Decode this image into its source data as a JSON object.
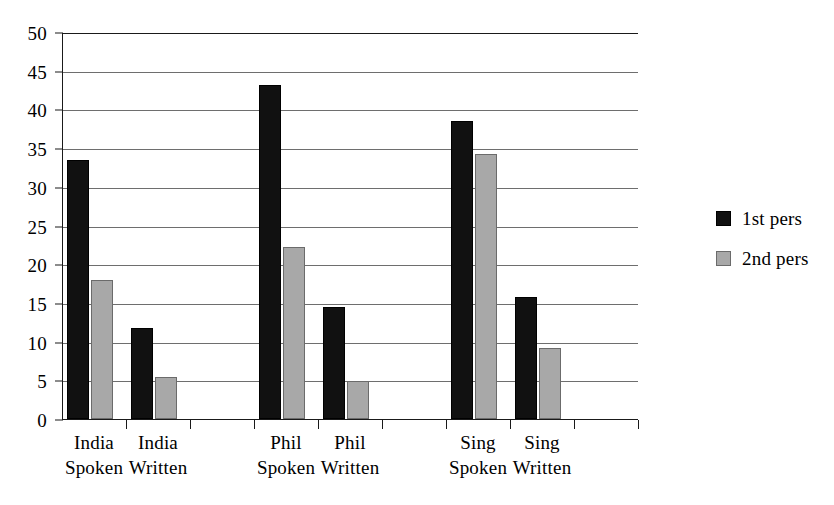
{
  "chart_data": {
    "type": "bar",
    "title": "",
    "subtitle": "",
    "xlabel": "",
    "ylabel": "",
    "ylim": [
      0,
      50
    ],
    "ytick_step": 5,
    "yticks": [
      0,
      5,
      10,
      15,
      20,
      25,
      30,
      35,
      40,
      45,
      50
    ],
    "ytick_labels": [
      "0",
      "5",
      "10",
      "15",
      "20",
      "25",
      "30",
      "35",
      "40",
      "45",
      "50"
    ],
    "grid": true,
    "grid_axis": "y",
    "legend_position": "right",
    "categories": [
      "India Spoken",
      "India Written",
      "",
      "Phil Spoken",
      "Phil Written",
      "",
      "Sing Spoken",
      "Sing Written",
      ""
    ],
    "category_lines": [
      [
        "India",
        "Spoken"
      ],
      [
        "India",
        "Written"
      ],
      [
        "",
        ""
      ],
      [
        "Phil",
        "Spoken"
      ],
      [
        "Phil",
        "Written"
      ],
      [
        "",
        ""
      ],
      [
        "Sing",
        "Spoken"
      ],
      [
        "Sing",
        "Written"
      ],
      [
        "",
        ""
      ]
    ],
    "series": [
      {
        "name": "1st pers",
        "color": "#111111",
        "values": [
          33.4,
          11.8,
          null,
          43.2,
          14.5,
          null,
          38.5,
          15.7,
          null
        ]
      },
      {
        "name": "2nd pers",
        "color": "#a8a8a8",
        "values": [
          18.0,
          5.4,
          null,
          22.2,
          4.9,
          null,
          34.2,
          9.2,
          null
        ]
      }
    ]
  },
  "legend": {
    "entries": [
      {
        "label": "1st pers",
        "color": "#111111"
      },
      {
        "label": "2nd pers",
        "color": "#a8a8a8"
      }
    ]
  },
  "colors": {
    "series_1st_pers": "#111111",
    "series_2nd_pers": "#a8a8a8",
    "axis": "#1a1a1a",
    "gridline": "#6e6e6e",
    "background": "#ffffff"
  }
}
